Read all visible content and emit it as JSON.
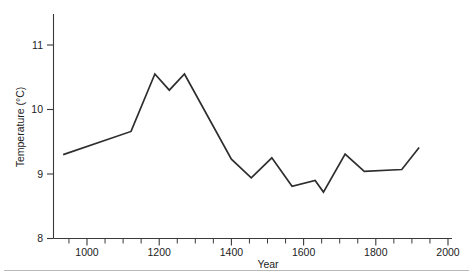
{
  "chart_data": {
    "type": "line",
    "title": "",
    "xlabel": "Year",
    "ylabel": "Temperature (°C)",
    "xlim": [
      900,
      2000
    ],
    "ylim": [
      8,
      11.6
    ],
    "grid": false,
    "legend": "none",
    "x_major_ticks": [
      1000,
      1200,
      1400,
      1600,
      1800,
      2000
    ],
    "x_major_tick_labels": [
      "1000",
      "1200",
      "1400",
      "1600",
      "1800",
      "2000"
    ],
    "x_minor_tick_interval": 50,
    "y_ticks": [
      8,
      9,
      10,
      11
    ],
    "y_tick_labels": [
      "8",
      "9",
      "10",
      "11"
    ],
    "series": [
      {
        "name": "Temperature",
        "color": "#2e2e2e",
        "x": [
          934,
          1122,
          1188,
          1228,
          1270,
          1400,
          1455,
          1512,
          1568,
          1632,
          1655,
          1715,
          1768,
          1872,
          1920
        ],
        "values": [
          9.3,
          9.66,
          10.55,
          10.3,
          10.55,
          9.23,
          8.94,
          9.25,
          8.81,
          8.9,
          8.72,
          9.31,
          9.04,
          9.07,
          9.41
        ]
      }
    ]
  },
  "axes": {
    "x_title": "Year",
    "y_title": "Temperature (°C)"
  }
}
